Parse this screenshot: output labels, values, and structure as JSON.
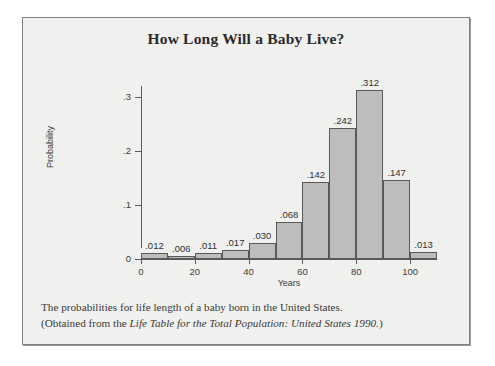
{
  "figure": {
    "title": "How Long Will a Baby Live?",
    "caption_line1": "The probabilities for life length of a baby born in the United States.",
    "caption_line2_prefix": "(Obtained from the ",
    "caption_line2_italic": "Life Table for the Total Population: United States 1990.",
    "caption_line2_suffix": ")",
    "frame_color": "#808080",
    "background_color": "#f0f0ee"
  },
  "chart_data": {
    "type": "bar",
    "title": "How Long Will a Baby Live?",
    "xlabel": "Years",
    "ylabel": "Probability",
    "categories": [
      "0-10",
      "10-20",
      "20-30",
      "30-40",
      "40-50",
      "50-60",
      "60-70",
      "70-80",
      "80-90",
      "90-100",
      "100-110"
    ],
    "bin_starts": [
      0,
      10,
      20,
      30,
      40,
      50,
      60,
      70,
      80,
      90,
      100
    ],
    "bin_width": 10,
    "values": [
      0.012,
      0.006,
      0.011,
      0.017,
      0.03,
      0.068,
      0.142,
      0.242,
      0.312,
      0.147,
      0.013
    ],
    "value_labels": [
      ".012",
      ".006",
      ".011",
      ".017",
      ".030",
      ".068",
      ".142",
      ".242",
      ".312",
      ".147",
      ".013"
    ],
    "xlim": [
      0,
      110
    ],
    "ylim": [
      0,
      0.32
    ],
    "x_ticks": [
      0,
      20,
      40,
      60,
      80,
      100
    ],
    "x_tick_labels": [
      "0",
      "20",
      "40",
      "60",
      "80",
      "100"
    ],
    "y_ticks": [
      0,
      0.1,
      0.2,
      0.3
    ],
    "y_tick_labels": [
      "0",
      ".1",
      ".2",
      ".3"
    ],
    "grid": false,
    "legend": false,
    "bar_fill_color": "#bdbdbd",
    "bar_edge_color": "#595959"
  }
}
